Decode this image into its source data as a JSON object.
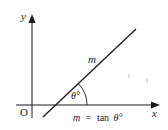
{
  "diagram": {
    "title": "",
    "axes": {
      "x_label": "x",
      "y_label": "y",
      "origin_label": "O"
    },
    "line": {
      "label": "m"
    },
    "angle": {
      "label": "θ°"
    },
    "formula": {
      "lhs": "m",
      "eq": "=",
      "rhs_fn": "tan",
      "rhs_arg": "θ°"
    },
    "colors": {
      "ink": "#1a1a1a",
      "background": "#ffffff"
    }
  }
}
